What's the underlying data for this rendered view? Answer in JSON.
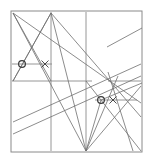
{
  "figure": {
    "width": 152,
    "height": 163,
    "background_color": "#ffffff",
    "stroke_color": "#6e6e6e",
    "frame_color": "#8a8a8a",
    "marker_color": "#3a3a3a",
    "stroke_width": 0.8,
    "frame": {
      "label": "bounding-square",
      "x": 11,
      "y": 11,
      "width": 131,
      "height": 141
    },
    "vertices": {
      "top_left": [
        13,
        13
      ],
      "top_mid": [
        51,
        13
      ],
      "top_right": [
        141,
        13
      ],
      "bottom_left": [
        13,
        151
      ],
      "bottom_mid": [
        86,
        151
      ],
      "bottom_right": [
        141,
        151
      ]
    },
    "guide_lines": [
      {
        "name": "vertical-guide-left",
        "x1": 51,
        "y1": 12,
        "x2": 51,
        "y2": 151
      },
      {
        "name": "vertical-guide-mid",
        "x1": 86,
        "y1": 12,
        "x2": 86,
        "y2": 151
      },
      {
        "name": "horizontal-guide-upper",
        "x1": 12,
        "y1": 64,
        "x2": 52,
        "y2": 64
      },
      {
        "name": "horizontal-guide-mid",
        "x1": 12,
        "y1": 81,
        "x2": 92,
        "y2": 81
      },
      {
        "name": "horizontal-guide-right-upper",
        "x1": 108,
        "y1": 81,
        "x2": 141,
        "y2": 81
      },
      {
        "name": "horizontal-guide-lower",
        "x1": 95,
        "y1": 100,
        "x2": 137,
        "y2": 100
      }
    ],
    "diagonals": [
      {
        "name": "diagonal-tl-to-bm",
        "x1": 13,
        "y1": 13,
        "x2": 86,
        "y2": 151
      },
      {
        "name": "diagonal-tl-to-br-far",
        "x1": 13,
        "y1": 13,
        "x2": 141,
        "y2": 103
      },
      {
        "name": "diagonal-tl-to-bl-lower",
        "x1": 13,
        "y1": 13,
        "x2": 51,
        "y2": 81
      },
      {
        "name": "diagonal-tm-to-bl",
        "x1": 51,
        "y1": 13,
        "x2": 13,
        "y2": 81
      },
      {
        "name": "diagonal-tm-to-bm",
        "x1": 51,
        "y1": 13,
        "x2": 86,
        "y2": 151
      },
      {
        "name": "diagonal-tm-to-right",
        "x1": 51,
        "y1": 13,
        "x2": 141,
        "y2": 117
      },
      {
        "name": "diagonal-bl-to-tm-steep",
        "x1": 13,
        "y1": 81,
        "x2": 51,
        "y2": 13
      },
      {
        "name": "diagonal-bm-to-tr-region",
        "x1": 86,
        "y1": 151,
        "x2": 118,
        "y2": 76
      },
      {
        "name": "diagonal-bm-to-right-edge",
        "x1": 86,
        "y1": 151,
        "x2": 141,
        "y2": 86
      },
      {
        "name": "diagonal-lowleft-to-upright",
        "x1": 13,
        "y1": 122,
        "x2": 141,
        "y2": 64
      },
      {
        "name": "diagonal-left-to-right-shallow",
        "x1": 13,
        "y1": 134,
        "x2": 141,
        "y2": 76
      },
      {
        "name": "diagonal-right-descending",
        "x1": 108,
        "y1": 72,
        "x2": 133,
        "y2": 151
      },
      {
        "name": "diagonal-mid-to-bottom-right",
        "x1": 86,
        "y1": 81,
        "x2": 141,
        "y2": 151
      },
      {
        "name": "segment-upper-right-free",
        "x1": 107,
        "y1": 47,
        "x2": 142,
        "y2": 28
      },
      {
        "name": "diagonal-circle2-to-upper-right",
        "x1": 101,
        "y1": 100,
        "x2": 142,
        "y2": 83
      },
      {
        "name": "diagonal-circle2-down-left",
        "x1": 101,
        "y1": 100,
        "x2": 86,
        "y2": 151
      }
    ],
    "markers": [
      {
        "name": "intersection-point-upper-left",
        "type": "circle",
        "cx": 22,
        "cy": 64,
        "r": 3.4
      },
      {
        "name": "intersection-point-lower-right",
        "type": "circle",
        "cx": 101,
        "cy": 100,
        "r": 3.4
      }
    ],
    "cross_marks": [
      {
        "name": "cross-mark-upper",
        "cx": 45,
        "cy": 64,
        "size": 3.5
      },
      {
        "name": "cross-mark-lower",
        "cx": 113,
        "cy": 100,
        "size": 3.5
      }
    ]
  }
}
